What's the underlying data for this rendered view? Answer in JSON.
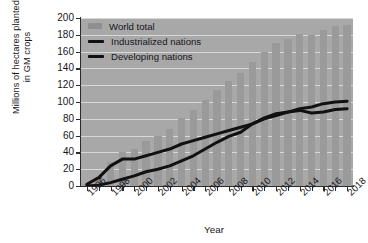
{
  "chart_data": {
    "type": "bar",
    "title": "",
    "xlabel": "Year",
    "ylabel": "Millions of hectares planted\nin GM crops",
    "ylim": [
      0,
      200
    ],
    "ytick_step": 20,
    "ytick_labels": [
      "200",
      "180",
      "160",
      "140",
      "120",
      "100",
      "80",
      "60",
      "40",
      "20",
      "0"
    ],
    "xlim": [
      1996,
      2018
    ],
    "grid": true,
    "grid_orientation": "horizontal",
    "legend_position": "top-left",
    "categories": [
      "1996",
      "1997",
      "1998",
      "1999",
      "2000",
      "2001",
      "2002",
      "2003",
      "2004",
      "2005",
      "2006",
      "2007",
      "2008",
      "2009",
      "2010",
      "2011",
      "2012",
      "2013",
      "2014",
      "2015",
      "2016",
      "2017",
      "2018"
    ],
    "xtick_labels": [
      "1996",
      "1998",
      "2000",
      "2002",
      "2004",
      "2006",
      "2008",
      "2010",
      "2012",
      "2014",
      "2016",
      "2018"
    ],
    "series": [
      {
        "name": "World total",
        "type": "bar",
        "color": "#9a9a9a",
        "values": [
          2,
          11,
          28,
          40,
          44,
          53,
          59,
          68,
          81,
          90,
          102,
          114,
          125,
          134,
          148,
          160,
          170,
          175,
          181,
          180,
          186,
          190,
          192
        ]
      },
      {
        "name": "Industrialized nations",
        "type": "line",
        "color": "#111111",
        "values": [
          2,
          10,
          24,
          32,
          32,
          36,
          40,
          44,
          50,
          54,
          58,
          62,
          66,
          70,
          74,
          80,
          84,
          88,
          90,
          87,
          88,
          91,
          92
        ]
      },
      {
        "name": "Developing nations",
        "type": "line",
        "color": "#111111",
        "values": [
          0,
          1,
          4,
          8,
          12,
          17,
          20,
          24,
          30,
          36,
          44,
          52,
          59,
          64,
          74,
          81,
          86,
          88,
          92,
          94,
          98,
          100,
          101
        ]
      }
    ]
  },
  "legend": {
    "items": [
      {
        "label": "World total",
        "marker": "bar-swatch"
      },
      {
        "label": "Industrialized nations",
        "marker": "line-swatch"
      },
      {
        "label": "Developing nations",
        "marker": "line-swatch"
      }
    ]
  },
  "axes": {
    "y_title": "Millions of hectares planted\nin GM crops",
    "x_title": "Year"
  },
  "colors": {
    "plot_background": "#a8a8a8",
    "bar": "#9a9a9a",
    "line": "#111111",
    "grid": "#ffffff",
    "axis": "#2b2b2b",
    "text": "#17171a"
  }
}
